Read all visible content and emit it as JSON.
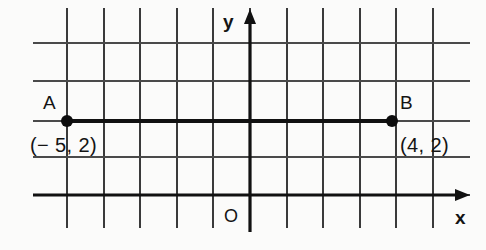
{
  "figure": {
    "type": "coordinate-grid-diagram",
    "background_color": "#fbfbfa",
    "ink_color": "#111111"
  },
  "axes": {
    "x_axis_label": "x",
    "y_axis_label": "y",
    "origin_label": "O",
    "x_axis_pixel_y": 195,
    "y_axis_pixel_x": 250,
    "x_arrow_direction": "right",
    "y_arrow_direction": "up"
  },
  "grid": {
    "unit_px_x": 36.5,
    "unit_px_y": 38,
    "vertical_lines_px": [
      67,
      104,
      140,
      177,
      213,
      250,
      287,
      323,
      360,
      396,
      433
    ],
    "horizontal_lines_px": [
      43,
      81,
      121,
      157,
      195
    ],
    "vertical_extent_px": [
      8,
      228
    ],
    "horizontal_extent_px": [
      33,
      470
    ],
    "grid_visible": true
  },
  "points": [
    {
      "name": "A",
      "label": "A",
      "coord_label": "(− 5, 2)",
      "x": -5,
      "y": 2,
      "pixel_x": 67,
      "pixel_y": 121,
      "label_position": "above-left",
      "coord_position": "below-left"
    },
    {
      "name": "B",
      "label": "B",
      "coord_label": "(4, 2)",
      "x": 4,
      "y": 2,
      "pixel_x": 392,
      "pixel_y": 121,
      "label_position": "above-right",
      "coord_position": "below-right"
    }
  ],
  "segment": {
    "from": "A",
    "to": "B",
    "x1": 67,
    "y1": 121,
    "x2": 392,
    "y2": 121
  }
}
